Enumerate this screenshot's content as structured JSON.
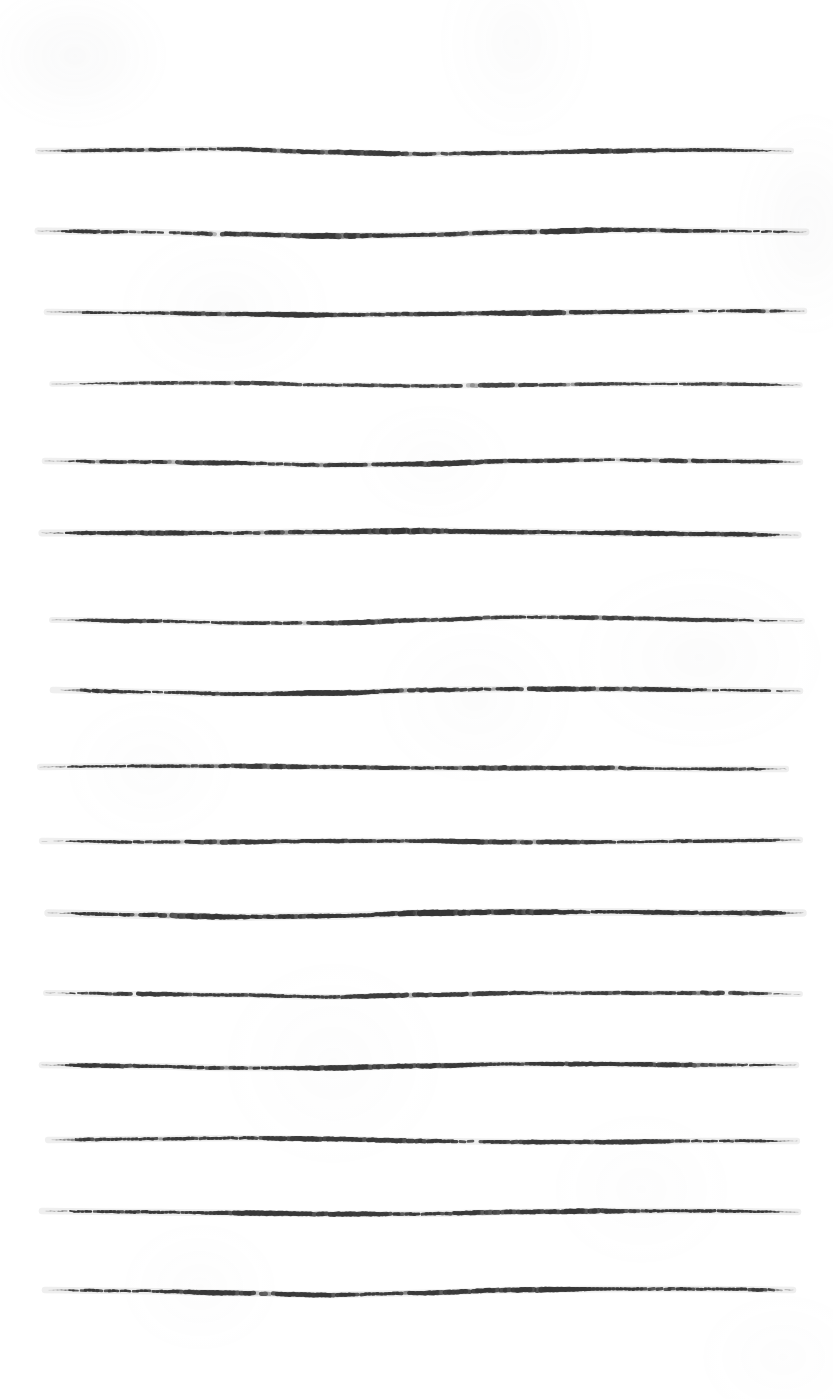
{
  "document": {
    "type": "scanned-page",
    "title": "Hand-drawn ruled notebook page",
    "description": "A scanned sheet of white paper bearing sixteen hand-drawn horizontal ruled lines. No text, headings, numbers or other marks are present.",
    "page_width": 833,
    "page_height": 1399,
    "background_color": "#ffffff",
    "ink_color": "#2e2e2e",
    "ink_color_light": "#5a5a5a",
    "text_content": "",
    "line_count": 16
  },
  "rules": [
    {
      "index": 1,
      "label": "ruled-line-1",
      "y": 151,
      "x_start": 38,
      "x_end": 791,
      "thickness": 4.2,
      "wave": [
        0,
        -1,
        -2,
        1,
        3,
        2,
        0,
        -1,
        0
      ],
      "opacity": 0.94
    },
    {
      "index": 2,
      "label": "ruled-line-2",
      "y": 231,
      "x_start": 38,
      "x_end": 806,
      "thickness": 4.6,
      "wave": [
        0,
        1,
        3,
        5,
        4,
        1,
        -1,
        0,
        1
      ],
      "opacity": 0.95
    },
    {
      "index": 3,
      "label": "ruled-line-3",
      "y": 312,
      "x_start": 47,
      "x_end": 804,
      "thickness": 4.4,
      "wave": [
        0,
        1,
        2,
        3,
        2,
        1,
        0,
        -1,
        -1
      ],
      "opacity": 0.95
    },
    {
      "index": 4,
      "label": "ruled-line-4",
      "y": 384,
      "x_start": 52,
      "x_end": 800,
      "thickness": 3.6,
      "wave": [
        0,
        -1,
        -1,
        1,
        2,
        1,
        0,
        0,
        1
      ],
      "opacity": 0.9
    },
    {
      "index": 5,
      "label": "ruled-line-5",
      "y": 461,
      "x_start": 45,
      "x_end": 800,
      "thickness": 4.3,
      "wave": [
        0,
        1,
        2,
        4,
        3,
        0,
        -1,
        0,
        1
      ],
      "opacity": 0.95
    },
    {
      "index": 6,
      "label": "ruled-line-6",
      "y": 533,
      "x_start": 42,
      "x_end": 798,
      "thickness": 4.8,
      "wave": [
        0,
        0,
        0,
        -1,
        -2,
        -1,
        0,
        1,
        2
      ],
      "opacity": 0.96
    },
    {
      "index": 7,
      "label": "ruled-line-7",
      "y": 620,
      "x_start": 52,
      "x_end": 802,
      "thickness": 4.0,
      "wave": [
        0,
        1,
        3,
        3,
        0,
        -3,
        -2,
        0,
        1
      ],
      "opacity": 0.93
    },
    {
      "index": 8,
      "label": "ruled-line-8",
      "y": 690,
      "x_start": 53,
      "x_end": 800,
      "thickness": 4.4,
      "wave": [
        0,
        2,
        4,
        3,
        0,
        -1,
        -1,
        0,
        1
      ],
      "opacity": 0.95
    },
    {
      "index": 9,
      "label": "ruled-line-9",
      "y": 767,
      "x_start": 40,
      "x_end": 786,
      "thickness": 4.2,
      "wave": [
        0,
        -1,
        -1,
        0,
        1,
        1,
        1,
        2,
        2
      ],
      "opacity": 0.94
    },
    {
      "index": 10,
      "label": "ruled-line-10",
      "y": 841,
      "x_start": 42,
      "x_end": 800,
      "thickness": 4.2,
      "wave": [
        0,
        1,
        1,
        0,
        0,
        1,
        1,
        0,
        -1
      ],
      "opacity": 0.94
    },
    {
      "index": 11,
      "label": "ruled-line-11",
      "y": 913,
      "x_start": 48,
      "x_end": 803,
      "thickness": 5.0,
      "wave": [
        0,
        2,
        4,
        3,
        0,
        -1,
        -1,
        0,
        0
      ],
      "opacity": 0.96
    },
    {
      "index": 12,
      "label": "ruled-line-12",
      "y": 993,
      "x_start": 46,
      "x_end": 800,
      "thickness": 4.0,
      "wave": [
        0,
        1,
        2,
        4,
        2,
        0,
        0,
        0,
        1
      ],
      "opacity": 0.93
    },
    {
      "index": 13,
      "label": "ruled-line-13",
      "y": 1065,
      "x_start": 42,
      "x_end": 796,
      "thickness": 4.4,
      "wave": [
        0,
        1,
        3,
        3,
        1,
        -1,
        -1,
        0,
        0
      ],
      "opacity": 0.95
    },
    {
      "index": 14,
      "label": "ruled-line-14",
      "y": 1140,
      "x_start": 48,
      "x_end": 797,
      "thickness": 4.2,
      "wave": [
        0,
        -1,
        -2,
        -1,
        1,
        2,
        2,
        1,
        1
      ],
      "opacity": 0.94
    },
    {
      "index": 15,
      "label": "ruled-line-15",
      "y": 1211,
      "x_start": 42,
      "x_end": 798,
      "thickness": 4.4,
      "wave": [
        0,
        1,
        2,
        3,
        3,
        1,
        0,
        0,
        1
      ],
      "opacity": 0.95
    },
    {
      "index": 16,
      "label": "ruled-line-16",
      "y": 1290,
      "x_start": 45,
      "x_end": 793,
      "thickness": 4.4,
      "wave": [
        0,
        1,
        3,
        5,
        3,
        0,
        -1,
        -1,
        0
      ],
      "opacity": 0.95
    }
  ]
}
